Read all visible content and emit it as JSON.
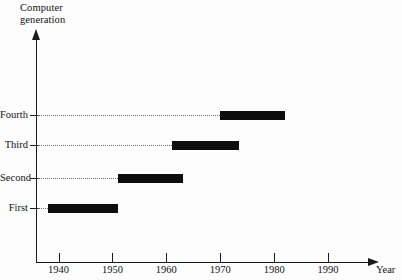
{
  "chart_data": {
    "type": "bar",
    "orientation": "horizontal",
    "subtype": "timeline-gantt",
    "title": "",
    "ylabel": "Computer generation",
    "xlabel": "Year",
    "categories": [
      "First",
      "Second",
      "Third",
      "Fourth"
    ],
    "xlim": [
      1936,
      1995
    ],
    "xticks": [
      1940,
      1950,
      1960,
      1970,
      1980,
      1990
    ],
    "xtick_labels": [
      "1940",
      "1950",
      "1960",
      "1970",
      "1980",
      "1990"
    ],
    "grid": false,
    "legend": false,
    "leader_lines": "dotted",
    "bar_color": "#0d0d0d",
    "axis_color": "#1a1a1a",
    "background": "#fdfdfd",
    "bars": [
      {
        "category": "Fourth",
        "start": 1970.0,
        "end": 1982.0
      },
      {
        "category": "Third",
        "start": 1961.0,
        "end": 1973.5
      },
      {
        "category": "Second",
        "start": 1951.0,
        "end": 1963.0
      },
      {
        "category": "First",
        "start": 1938.0,
        "end": 1951.0
      }
    ]
  },
  "axis_title_text": "Computer\ngeneration",
  "x_axis_name": "Year"
}
